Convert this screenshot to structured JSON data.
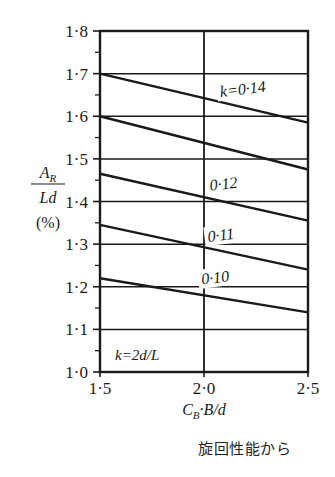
{
  "figure": {
    "caption": "旋回性能から",
    "note_in_plot": "k=2d/L"
  },
  "chart_data": {
    "type": "line",
    "title": "",
    "subtitle": "",
    "xlabel": "C_B·B/d",
    "ylabel": "A_R/Ld (%)",
    "xlabel_parts": {
      "c": "C",
      "b_sub": "B",
      "mid": "·B/d"
    },
    "ylabel_parts": {
      "num": "A",
      "num_sub": "R",
      "den": "Ld",
      "unit": "(%)"
    },
    "xlim": [
      1.5,
      2.5
    ],
    "ylim": [
      1.0,
      1.8
    ],
    "xticks": [
      1.5,
      2.0,
      2.5
    ],
    "xtick_labels": [
      "1·5",
      "2·0",
      "2·5"
    ],
    "yticks": [
      1.0,
      1.1,
      1.2,
      1.3,
      1.4,
      1.5,
      1.6,
      1.7,
      1.8
    ],
    "ytick_labels": [
      "1·0",
      "1·1",
      "1·2",
      "1·3",
      "1·4",
      "1·5",
      "1·6",
      "1·7",
      "1·8"
    ],
    "y_minor_ticks": [
      1.05,
      1.15,
      1.25,
      1.35,
      1.45,
      1.55,
      1.65,
      1.75
    ],
    "grid": true,
    "grid_x": true,
    "grid_y": true,
    "legend": "inline-labels",
    "series": [
      {
        "name": "k=0.14",
        "label": "k=0·14",
        "label_show": true,
        "label_x": 2.08,
        "label_y": 1.645,
        "x": [
          1.5,
          2.5
        ],
        "y": [
          1.7,
          1.585
        ]
      },
      {
        "name": "k=0.13",
        "label": "0·13",
        "label_show": false,
        "label_x": 2.08,
        "label_y": 1.52,
        "x": [
          1.5,
          2.5
        ],
        "y": [
          1.6,
          1.475
        ]
      },
      {
        "name": "k=0.12",
        "label": "0·12",
        "label_show": true,
        "label_x": 2.03,
        "label_y": 1.425,
        "x": [
          1.5,
          2.5
        ],
        "y": [
          1.465,
          1.355
        ]
      },
      {
        "name": "k=0.11",
        "label": "0·11",
        "label_show": true,
        "label_x": 2.02,
        "label_y": 1.305,
        "x": [
          1.5,
          2.5
        ],
        "y": [
          1.345,
          1.24
        ]
      },
      {
        "name": "k=0.10",
        "label": "0·10",
        "label_show": true,
        "label_x": 1.99,
        "label_y": 1.205,
        "x": [
          1.5,
          2.5
        ],
        "y": [
          1.22,
          1.14
        ]
      }
    ],
    "colors": {
      "line": "#1a1a1a",
      "grid": "#1a1a1a",
      "frame": "#1a1a1a",
      "background": "#ffffff",
      "text": "#1a1a1a"
    }
  }
}
